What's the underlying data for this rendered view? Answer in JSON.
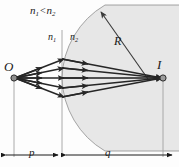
{
  "figure": {
    "type": "optics-ray-diagram",
    "background_color": "#fdfdfd",
    "medium_shade_color": "#e6e6e6",
    "ray_color": "#262626",
    "construction_line_color": "#9a9a9a",
    "labels": {
      "index_comparison": {
        "n_left": "n",
        "n_left_sub": "1",
        "operator": "<",
        "n_right": "n",
        "n_right_sub": "2"
      },
      "medium_left": {
        "symbol": "n",
        "subscript": "1"
      },
      "medium_right": {
        "symbol": "n",
        "subscript": "2"
      },
      "radius": "R",
      "object_point": "O",
      "image_point": "I",
      "object_distance": "p",
      "image_distance": "q"
    },
    "geometry": {
      "object_x": 14,
      "object_y": 78,
      "vertex_x": 62,
      "image_x": 163,
      "image_y": 78,
      "sphere_center_x": 149,
      "sphere_center_y": 78,
      "sphere_radius": 87,
      "ray_count": 5,
      "baseline_y": 155
    }
  }
}
